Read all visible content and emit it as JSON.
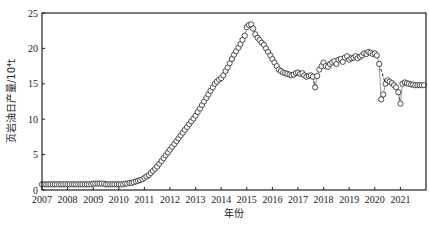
{
  "chart_data": {
    "type": "scatter",
    "title": "",
    "xlabel": "年份",
    "ylabel": "页岩油日产量/10⁴t",
    "xlim": [
      2007,
      2022
    ],
    "ylim": [
      0,
      25
    ],
    "x_ticks": [
      "2007",
      "2008",
      "2009",
      "2010",
      "2011",
      "2012",
      "2013",
      "2014",
      "2015",
      "2016",
      "2017",
      "2018",
      "2019",
      "2020",
      "2021"
    ],
    "y_ticks": [
      "0",
      "5",
      "10",
      "15",
      "20",
      "25"
    ],
    "grid": false,
    "legend": null,
    "marker": "open-circle",
    "dashed_segments": [
      [
        2017.6,
        2017.7
      ],
      [
        2020.2,
        2020.4
      ],
      [
        2020.9,
        2021.0
      ]
    ],
    "series": [
      {
        "name": "页岩油日产量",
        "x": [
          2007.0,
          2007.08,
          2007.17,
          2007.25,
          2007.33,
          2007.42,
          2007.5,
          2007.58,
          2007.67,
          2007.75,
          2007.83,
          2007.92,
          2008.0,
          2008.08,
          2008.17,
          2008.25,
          2008.33,
          2008.42,
          2008.5,
          2008.58,
          2008.67,
          2008.75,
          2008.83,
          2008.92,
          2009.0,
          2009.08,
          2009.17,
          2009.25,
          2009.33,
          2009.42,
          2009.5,
          2009.58,
          2009.67,
          2009.75,
          2009.83,
          2009.92,
          2010.0,
          2010.08,
          2010.17,
          2010.25,
          2010.33,
          2010.42,
          2010.5,
          2010.58,
          2010.67,
          2010.75,
          2010.83,
          2010.92,
          2011.0,
          2011.08,
          2011.17,
          2011.25,
          2011.33,
          2011.42,
          2011.5,
          2011.58,
          2011.67,
          2011.75,
          2011.83,
          2011.92,
          2012.0,
          2012.08,
          2012.17,
          2012.25,
          2012.33,
          2012.42,
          2012.5,
          2012.58,
          2012.67,
          2012.75,
          2012.83,
          2012.92,
          2013.0,
          2013.08,
          2013.17,
          2013.25,
          2013.33,
          2013.42,
          2013.5,
          2013.58,
          2013.67,
          2013.75,
          2013.83,
          2013.92,
          2014.0,
          2014.08,
          2014.17,
          2014.25,
          2014.33,
          2014.42,
          2014.5,
          2014.58,
          2014.67,
          2014.75,
          2014.83,
          2014.92,
          2015.0,
          2015.08,
          2015.17,
          2015.25,
          2015.33,
          2015.42,
          2015.5,
          2015.58,
          2015.67,
          2015.75,
          2015.83,
          2015.92,
          2016.0,
          2016.08,
          2016.17,
          2016.25,
          2016.33,
          2016.42,
          2016.5,
          2016.58,
          2016.67,
          2016.75,
          2016.83,
          2016.92,
          2017.0,
          2017.08,
          2017.17,
          2017.25,
          2017.33,
          2017.42,
          2017.5,
          2017.58,
          2017.67,
          2017.75,
          2017.83,
          2017.92,
          2018.0,
          2018.08,
          2018.17,
          2018.25,
          2018.33,
          2018.42,
          2018.5,
          2018.58,
          2018.67,
          2018.75,
          2018.83,
          2018.92,
          2019.0,
          2019.08,
          2019.17,
          2019.25,
          2019.33,
          2019.42,
          2019.5,
          2019.58,
          2019.67,
          2019.75,
          2019.83,
          2019.92,
          2020.0,
          2020.08,
          2020.17,
          2020.25,
          2020.33,
          2020.42,
          2020.5,
          2020.58,
          2020.67,
          2020.75,
          2020.83,
          2020.92,
          2021.0,
          2021.08,
          2021.17,
          2021.25,
          2021.33,
          2021.42,
          2021.5,
          2021.58,
          2021.67,
          2021.75,
          2021.83,
          2021.92
        ],
        "y": [
          0.8,
          0.8,
          0.8,
          0.8,
          0.8,
          0.8,
          0.8,
          0.8,
          0.8,
          0.8,
          0.8,
          0.8,
          0.8,
          0.8,
          0.8,
          0.8,
          0.8,
          0.8,
          0.8,
          0.8,
          0.8,
          0.8,
          0.8,
          0.8,
          0.9,
          0.9,
          0.9,
          0.9,
          0.9,
          0.9,
          0.8,
          0.8,
          0.8,
          0.8,
          0.8,
          0.8,
          0.8,
          0.8,
          0.8,
          0.9,
          0.9,
          1.0,
          1.0,
          1.1,
          1.2,
          1.3,
          1.4,
          1.5,
          1.7,
          1.9,
          2.1,
          2.4,
          2.7,
          3.0,
          3.3,
          3.7,
          4.1,
          4.5,
          4.9,
          5.3,
          5.7,
          6.1,
          6.5,
          6.9,
          7.3,
          7.7,
          8.1,
          8.5,
          8.9,
          9.3,
          9.7,
          10.1,
          10.5,
          11.0,
          11.5,
          12.0,
          12.5,
          13.0,
          13.5,
          14.0,
          14.5,
          15.0,
          15.3,
          15.6,
          15.8,
          16.2,
          16.8,
          17.3,
          17.9,
          18.5,
          19.1,
          19.6,
          20.1,
          20.6,
          21.2,
          21.8,
          23.0,
          23.3,
          23.4,
          22.8,
          22.0,
          21.5,
          21.2,
          20.8,
          20.5,
          20.0,
          19.5,
          19.0,
          18.5,
          18.0,
          17.5,
          17.0,
          16.8,
          16.6,
          16.5,
          16.4,
          16.3,
          16.2,
          16.3,
          16.5,
          16.6,
          16.4,
          16.5,
          16.2,
          16.0,
          16.1,
          16.2,
          16.0,
          14.5,
          16.1,
          17.0,
          17.5,
          18.0,
          17.5,
          17.4,
          17.8,
          18.0,
          18.2,
          17.8,
          18.4,
          18.5,
          18.1,
          18.7,
          18.9,
          18.4,
          18.6,
          18.7,
          18.9,
          18.6,
          18.8,
          19.0,
          19.3,
          19.2,
          19.5,
          19.4,
          19.2,
          19.3,
          19.0,
          17.8,
          12.8,
          13.5,
          15.0,
          15.5,
          15.3,
          15.1,
          14.8,
          14.5,
          13.8,
          12.2,
          15.0,
          15.2,
          15.1,
          15.0,
          14.9,
          14.9,
          14.8,
          14.8,
          14.8,
          14.8,
          14.8
        ]
      }
    ]
  }
}
